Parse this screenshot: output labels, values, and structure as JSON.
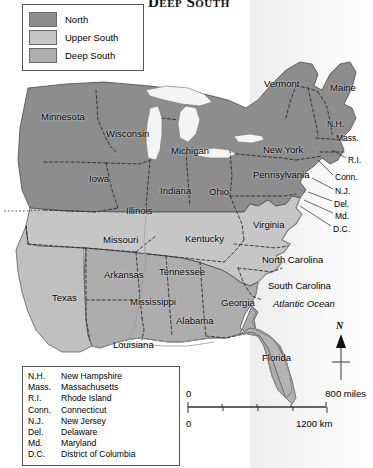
{
  "title": "Deep South",
  "legend": {
    "items": [
      {
        "label": "North",
        "color": "#8d8d8d"
      },
      {
        "label": "Upper South",
        "color": "#c6c6c6"
      },
      {
        "label": "Deep South",
        "color": "#adadad"
      }
    ]
  },
  "abbreviations": {
    "rows": [
      {
        "key": "N.H.",
        "value": "New Hampshire"
      },
      {
        "key": "Mass.",
        "value": "Massachusetts"
      },
      {
        "key": "R.I.",
        "value": "Rhode Island"
      },
      {
        "key": "Conn.",
        "value": "Connecticut"
      },
      {
        "key": "N.J.",
        "value": "New Jersey"
      },
      {
        "key": "Del.",
        "value": "Delaware"
      },
      {
        "key": "Md.",
        "value": "Maryland"
      },
      {
        "key": "D.C.",
        "value": "District of Columbia"
      }
    ]
  },
  "compass": {
    "north": "N"
  },
  "scale": {
    "miles_zero": "0",
    "miles_max": "800 miles",
    "km_zero": "0",
    "km_max": "1200 km"
  },
  "map_labels": {
    "states": [
      {
        "name": "Minnesota",
        "x": 41,
        "y": 111
      },
      {
        "name": "Wisconsin",
        "x": 106,
        "y": 128
      },
      {
        "name": "Michigan",
        "x": 171,
        "y": 145
      },
      {
        "name": "Iowa",
        "x": 89,
        "y": 173
      },
      {
        "name": "Indiana",
        "x": 160,
        "y": 185
      },
      {
        "name": "Ohio",
        "x": 209,
        "y": 186
      },
      {
        "name": "Illinois",
        "x": 126,
        "y": 205
      },
      {
        "name": "Pennsylvania",
        "x": 253,
        "y": 169
      },
      {
        "name": "New York",
        "x": 263,
        "y": 144
      },
      {
        "name": "Vermont",
        "x": 264,
        "y": 78
      },
      {
        "name": "Maine",
        "x": 330,
        "y": 82
      },
      {
        "name": "Missouri",
        "x": 103,
        "y": 234
      },
      {
        "name": "Kentucky",
        "x": 185,
        "y": 233
      },
      {
        "name": "Virginia",
        "x": 253,
        "y": 219
      },
      {
        "name": "Arkansas",
        "x": 104,
        "y": 269
      },
      {
        "name": "Tennessee",
        "x": 159,
        "y": 266
      },
      {
        "name": "North Carolina",
        "x": 262,
        "y": 254
      },
      {
        "name": "South Carolina",
        "x": 268,
        "y": 280
      },
      {
        "name": "Texas",
        "x": 52,
        "y": 292
      },
      {
        "name": "Mississippi",
        "x": 130,
        "y": 296
      },
      {
        "name": "Alabama",
        "x": 176,
        "y": 315
      },
      {
        "name": "Georgia",
        "x": 221,
        "y": 297
      },
      {
        "name": "Louisiana",
        "x": 113,
        "y": 339
      },
      {
        "name": "Florida",
        "x": 262,
        "y": 352
      }
    ],
    "abbrev_on_map": [
      {
        "name": "N.H.",
        "x": 327,
        "y": 119
      },
      {
        "name": "Mass.",
        "x": 336,
        "y": 133
      },
      {
        "name": "R.I.",
        "x": 348,
        "y": 155
      },
      {
        "name": "Conn.",
        "x": 335,
        "y": 172
      },
      {
        "name": "N.J.",
        "x": 335,
        "y": 186
      },
      {
        "name": "Del.",
        "x": 334,
        "y": 199
      },
      {
        "name": "Md.",
        "x": 335,
        "y": 211
      },
      {
        "name": "D.C.",
        "x": 333,
        "y": 224
      }
    ],
    "water": [
      {
        "name": "Atlantic Ocean",
        "x": 273,
        "y": 298
      }
    ]
  }
}
